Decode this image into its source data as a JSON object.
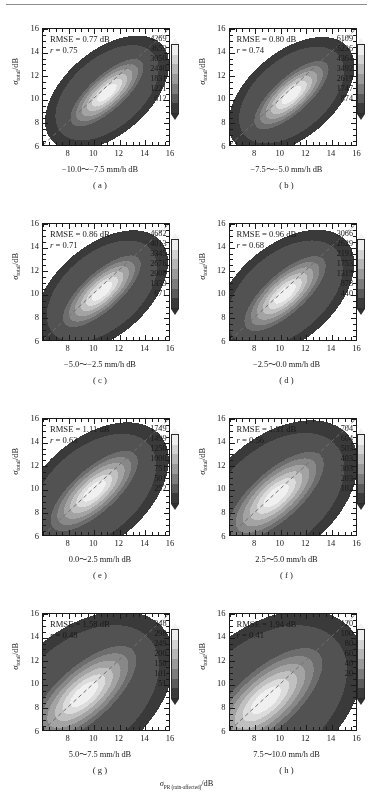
{
  "figure": {
    "global_xlabel_symbol": "σ",
    "global_xlabel_sub": "PR (rain-affected)",
    "global_xlabel_unit": "/dB",
    "ylabel_symbol": "σ",
    "ylabel_sub": "total",
    "ylabel_unit": "/dB"
  },
  "axes": {
    "xlim": [
      6,
      16
    ],
    "ylim": [
      6,
      16
    ],
    "xticks": [
      8,
      10,
      12,
      14,
      16
    ],
    "yticks": [
      6,
      8,
      10,
      12,
      14,
      16
    ],
    "xtick_labels": [
      "8",
      "10",
      "12",
      "14",
      "16"
    ],
    "ytick_labels": [
      "6",
      "8",
      "10",
      "12",
      "14",
      "16"
    ],
    "minor_tick_step": 0.5,
    "grid": false,
    "reference_line": "1:1 dashed diagonal"
  },
  "chart_data": {
    "type": "heatmap",
    "title": "",
    "xlabel": "σ_PR (rain-affected) /dB",
    "ylabel": "σ_total /dB",
    "xlim": [
      6,
      16
    ],
    "ylim": [
      6,
      16
    ],
    "panel_count": 8,
    "colormap": "grayscale (dark = low counts, light = high counts)",
    "panels": [
      {
        "id": "a",
        "label": "( a )",
        "rmse_label": "RMSE = 0.77 dB",
        "rmse": 0.77,
        "r_label": "r = 0.75",
        "r": 0.75,
        "xlabel": "−10.0～−7.5 mm/h dB",
        "rain_rate_bin": [
          -10.0,
          -7.5
        ],
        "colorbar_ticks": [
          4269,
          3659,
          3050,
          2440,
          1831,
          1221,
          612
        ],
        "colorbar_max": 4269,
        "density_center": [
          11.0,
          10.6
        ],
        "density_spread": "narrow elongated ridge along 1:1 line"
      },
      {
        "id": "b",
        "label": "( b )",
        "rmse_label": "RMSE = 0.80 dB",
        "rmse": 0.8,
        "r_label": "r = 0.74",
        "r": 0.74,
        "xlabel": "−7.5～−5.0 mm/h dB",
        "rain_rate_bin": [
          -7.5,
          -5.0
        ],
        "colorbar_ticks": [
          6109,
          5236,
          4364,
          3492,
          2619,
          1747,
          874
        ],
        "colorbar_max": 6109,
        "density_center": [
          10.8,
          10.4
        ],
        "density_spread": "narrow elongated ridge along 1:1 line"
      },
      {
        "id": "c",
        "label": "( c )",
        "rmse_label": "RMSE = 0.86 dB",
        "rmse": 0.86,
        "r_label": "r = 0.71",
        "r": 0.71,
        "xlabel": "−5.0～−2.5 mm/h dB",
        "rain_rate_bin": [
          -5.0,
          -2.5
        ],
        "colorbar_ticks": [
          4682,
          4013,
          3345,
          2676,
          2008,
          1339,
          671
        ],
        "colorbar_max": 4682,
        "density_center": [
          10.6,
          10.3
        ],
        "density_spread": "elongated ridge along 1:1 line"
      },
      {
        "id": "d",
        "label": "( d )",
        "rmse_label": "RMSE = 0.96 dB",
        "rmse": 0.96,
        "r_label": "r = 0.68",
        "r": 0.68,
        "xlabel": "−2.5～0.0 mm/h dB",
        "rain_rate_bin": [
          -2.5,
          0.0
        ],
        "colorbar_ticks": [
          3066,
          2629,
          2191,
          1753,
          1315,
          878,
          440
        ],
        "colorbar_max": 3066,
        "density_center": [
          10.3,
          10.1
        ],
        "density_spread": "broadening ellipse along 1:1 line"
      },
      {
        "id": "e",
        "label": "( e )",
        "rmse_label": "RMSE = 1.11 dB",
        "rmse": 1.11,
        "r_label": "r = 0.63",
        "r": 0.63,
        "xlabel": "0.0～2.5 mm/h dB",
        "rain_rate_bin": [
          0.0,
          2.5
        ],
        "colorbar_ticks": [
          1749,
          1499,
          1250,
          1000,
          751,
          501,
          252
        ],
        "colorbar_max": 1749,
        "density_center": [
          10.0,
          9.9
        ],
        "density_spread": "broad ellipse"
      },
      {
        "id": "f",
        "label": "( f )",
        "rmse_label": "RMSE = 1.31 dB",
        "rmse": 1.31,
        "r_label": "r = 0.56",
        "r": 0.56,
        "xlabel": "2.5～5.0 mm/h dB",
        "rain_rate_bin": [
          2.5,
          5.0
        ],
        "colorbar_ticks": [
          704,
          604,
          503,
          403,
          303,
          203,
          102
        ],
        "colorbar_max": 704,
        "density_center": [
          9.6,
          9.5
        ],
        "density_spread": "broad ellipse"
      },
      {
        "id": "g",
        "label": "( g )",
        "rmse_label": "RMSE = 1.58 dB",
        "rmse": 1.58,
        "r_label": "r = 0.48",
        "r": 0.48,
        "xlabel": "5.0～7.5 mm/h dB",
        "rain_rate_bin": [
          5.0,
          7.5
        ],
        "colorbar_ticks": [
          348,
          298,
          249,
          200,
          150,
          101,
          51
        ],
        "colorbar_max": 348,
        "density_center": [
          9.2,
          9.2
        ],
        "density_spread": "wide diffuse ellipse"
      },
      {
        "id": "h",
        "label": "( h )",
        "rmse_label": "RMSE = 1.94 dB",
        "rmse": 1.94,
        "r_label": "r = 0.41",
        "r": 0.41,
        "xlabel": "7.5～10.0 mm/h dB",
        "rain_rate_bin": [
          7.5,
          10.0
        ],
        "colorbar_ticks": [
          120,
          100,
          80,
          60,
          40,
          20
        ],
        "colorbar_max": 120,
        "density_center": [
          8.8,
          8.7
        ],
        "density_spread": "wide diffuse ellipse"
      }
    ]
  }
}
